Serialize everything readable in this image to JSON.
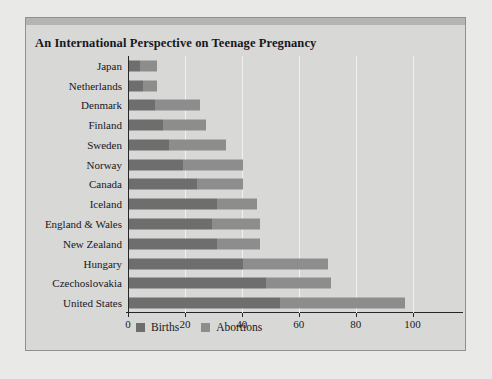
{
  "chart_data": {
    "type": "bar",
    "orientation": "horizontal",
    "stacked": true,
    "title": "An International Perspective on Teenage Pregnancy",
    "xlabel": "",
    "ylabel": "",
    "xlim": [
      0,
      110
    ],
    "xticks": [
      0,
      20,
      40,
      60,
      80,
      100
    ],
    "gridlines": [
      20,
      40,
      60,
      80,
      100
    ],
    "grid": true,
    "legend_position": "bottom-left",
    "categories": [
      "Japan",
      "Netherlands",
      "Denmark",
      "Finland",
      "Sweden",
      "Norway",
      "Canada",
      "Iceland",
      "England & Wales",
      "New Zealand",
      "Hungary",
      "Czechoslovakia",
      "United States"
    ],
    "series": [
      {
        "name": "Births",
        "color": "#6e6e6e",
        "values": [
          4,
          5,
          9,
          12,
          14,
          19,
          24,
          31,
          29,
          31,
          40,
          48,
          53
        ]
      },
      {
        "name": "Abortions",
        "color": "#8d8d8d",
        "values": [
          6,
          5,
          16,
          15,
          20,
          21,
          16,
          14,
          17,
          15,
          30,
          23,
          44
        ]
      }
    ],
    "totals": [
      10,
      10,
      25,
      27,
      34,
      40,
      40,
      45,
      46,
      46,
      70,
      71,
      97
    ]
  },
  "legend": {
    "items": [
      {
        "label": "Births",
        "color": "#6e6e6e"
      },
      {
        "label": "Abortions",
        "color": "#8d8d8d"
      }
    ]
  }
}
